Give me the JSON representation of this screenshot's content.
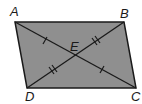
{
  "diagram": {
    "type": "parallelogram",
    "fill_color": "#8f8f8f",
    "stroke_color": "#1a1a1a",
    "vertices": {
      "A": {
        "label": "A",
        "x": 15,
        "y": 22
      },
      "B": {
        "label": "B",
        "x": 124,
        "y": 22
      },
      "C": {
        "label": "C",
        "x": 136,
        "y": 88
      },
      "D": {
        "label": "D",
        "x": 27,
        "y": 88
      }
    },
    "intersection": {
      "label": "E",
      "x": 75.5,
      "y": 55
    },
    "diagonals": [
      {
        "from": "A",
        "to": "C",
        "tick_marks": 1
      },
      {
        "from": "B",
        "to": "D",
        "tick_marks": 2
      }
    ]
  }
}
